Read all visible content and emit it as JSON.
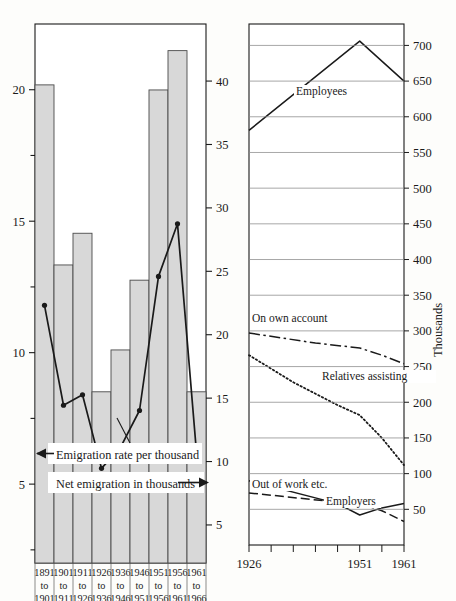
{
  "figure": {
    "background": "#fdfdfb",
    "ink": "#1a1a1a",
    "bar_fill": "#d8d8d8",
    "bar_stroke": "#4a4a4a",
    "grid_color": "#8a8a8a"
  },
  "left_panel": {
    "name": "emigration-chart",
    "annotations": [
      {
        "text": "Emigration rate per thousand",
        "arrow": "left"
      },
      {
        "text": "Net emigration in thousands",
        "arrow": "right"
      }
    ],
    "left_axis": {
      "label": "",
      "ticks": [
        5,
        10,
        15,
        20
      ],
      "minor_ticks": [
        2.5,
        7.5,
        12.5,
        17.5
      ],
      "range": [
        2.0,
        22.5
      ]
    },
    "right_axis": {
      "label": "",
      "ticks": [
        5,
        10,
        15,
        20,
        25,
        30,
        35,
        40
      ],
      "range": [
        2.0,
        44.5
      ]
    }
  },
  "right_panel": {
    "name": "occupation-status-chart",
    "y_axis_title": "Thousands",
    "left_axis_ticks": [],
    "right_axis": {
      "ticks": [
        50,
        100,
        150,
        200,
        250,
        300,
        350,
        400,
        450,
        500,
        550,
        600,
        650,
        700
      ],
      "range": [
        0,
        730
      ]
    },
    "x_axis": {
      "labels": [
        "1926",
        "1951",
        "1961"
      ],
      "label_values": [
        1926,
        1951,
        1961
      ],
      "tick_values": [
        1926,
        1931,
        1936,
        1941,
        1946,
        1951,
        1956,
        1961
      ],
      "range": [
        1926,
        1961
      ]
    }
  },
  "chart_data": [
    {
      "type": "bar",
      "name": "emigration",
      "title": "",
      "xlabel": "",
      "ylabel": "Net emigration in thousands",
      "categories": [
        "1891 to 1901",
        "1901 to 1911",
        "1911 to 1926",
        "1926 to 1936",
        "1936 to 1946",
        "1946 to 1951",
        "1951 to 1956",
        "1956 to 1961",
        "1961 to 1966"
      ],
      "category_lines": [
        [
          "1891",
          "to",
          "1901"
        ],
        [
          "1901",
          "to",
          "1911"
        ],
        [
          "1911",
          "to",
          "1926"
        ],
        [
          "1926",
          "to",
          "1936"
        ],
        [
          "1936",
          "to",
          "1946"
        ],
        [
          "1946",
          "to",
          "1951"
        ],
        [
          "1951",
          "to",
          "1956"
        ],
        [
          "1956",
          "to",
          "1961"
        ],
        [
          "1961",
          "to",
          "1966"
        ]
      ],
      "values": [
        39.7,
        25.5,
        28.0,
        15.5,
        18.8,
        24.3,
        39.3,
        42.4,
        15.5
      ],
      "ylim": [
        2.0,
        44.5
      ],
      "grid": false,
      "legend": "none",
      "series": [
        {
          "name": "Emigration rate per thousand",
          "axis": "left",
          "style": "solid-markers",
          "values": [
            11.8,
            8.0,
            8.4,
            5.6,
            6.4,
            7.8,
            12.9,
            14.9,
            6.2
          ],
          "ylim": [
            2.0,
            22.5
          ]
        }
      ]
    },
    {
      "type": "line",
      "name": "occupational-status",
      "title": "",
      "xlabel": "",
      "ylabel": "Thousands",
      "x": [
        1926,
        1931,
        1936,
        1941,
        1946,
        1951,
        1956,
        1961
      ],
      "xlim": [
        1926,
        1961
      ],
      "ylim": [
        0,
        730
      ],
      "grid": true,
      "legend": "inline-labels",
      "series": [
        {
          "name": "Employees",
          "style": "solid",
          "points": [
            [
              1926,
              581
            ],
            [
              1951,
              706
            ],
            [
              1961,
              650
            ]
          ]
        },
        {
          "name": "On own account",
          "style": "dash-dot",
          "points": [
            [
              1926,
              297
            ],
            [
              1941,
              283
            ],
            [
              1951,
              276
            ],
            [
              1956,
              266
            ],
            [
              1961,
              254
            ]
          ]
        },
        {
          "name": "Relatives assisting",
          "style": "dotted",
          "points": [
            [
              1926,
              266
            ],
            [
              1936,
              228
            ],
            [
              1946,
              196
            ],
            [
              1951,
              182
            ],
            [
              1956,
              150
            ],
            [
              1961,
              112
            ]
          ]
        },
        {
          "name": "Out of work etc.",
          "style": "solid",
          "points": [
            [
              1926,
              90
            ],
            [
              1946,
              58
            ],
            [
              1951,
              42
            ],
            [
              1956,
              52
            ],
            [
              1961,
              58
            ]
          ]
        },
        {
          "name": "Employers",
          "style": "dashed",
          "points": [
            [
              1926,
              73
            ],
            [
              1946,
              60
            ],
            [
              1951,
              58
            ],
            [
              1956,
              48
            ],
            [
              1961,
              33
            ]
          ]
        }
      ]
    }
  ]
}
